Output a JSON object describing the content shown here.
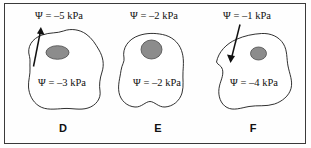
{
  "figure": {
    "background_color": "#fefefe",
    "frame_color": "#3a3a3a",
    "cell_outline_color": "#1a1a1a",
    "nucleus_fill_color": "#8c8c8c",
    "nucleus_outline_color": "#4a4a4a",
    "arrow_color": "#111111"
  },
  "panels": [
    {
      "id": "D",
      "letter": "D",
      "external_potential": "Ψ = –5 kPa",
      "internal_potential": "Ψ = –3 kPa",
      "arrow": "outward-up-left",
      "has_arrow": true
    },
    {
      "id": "E",
      "letter": "E",
      "external_potential": "Ψ = –2 kPa",
      "internal_potential": "Ψ = –2 kPa",
      "arrow": "none",
      "has_arrow": false
    },
    {
      "id": "F",
      "letter": "F",
      "external_potential": "Ψ = –1 kPa",
      "internal_potential": "Ψ = –4 kPa",
      "arrow": "inward-down-left",
      "has_arrow": true
    }
  ]
}
